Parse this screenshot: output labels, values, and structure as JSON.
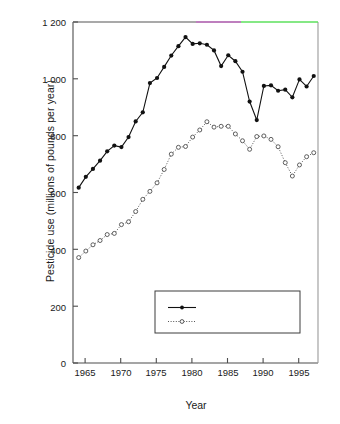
{
  "chart_data": {
    "type": "line",
    "title": "",
    "xlabel": "Year",
    "ylabel": "Pesticide use (millions of pounds per year)",
    "xlim": [
      1963.2,
      1997.6
    ],
    "ylim": [
      0,
      1200
    ],
    "xticks": [
      1965,
      1970,
      1975,
      1980,
      1985,
      1990,
      1995
    ],
    "xtick_labels": [
      "1965",
      "1970",
      "1975",
      "1980",
      "1985",
      "1990",
      "1995"
    ],
    "yticks": [
      0,
      200,
      400,
      600,
      800,
      1000,
      1200
    ],
    "ytick_labels": [
      "0",
      "200",
      "400",
      "600",
      "800",
      "1 000",
      "1 200"
    ],
    "grid": false,
    "legend_position": "lower right",
    "x": [
      1964,
      1965,
      1966,
      1967,
      1968,
      1969,
      1970,
      1971,
      1972,
      1973,
      1974,
      1975,
      1976,
      1977,
      1978,
      1979,
      1980,
      1981,
      1982,
      1983,
      1984,
      1985,
      1986,
      1987,
      1988,
      1989,
      1990,
      1991,
      1992,
      1993,
      1994,
      1995,
      1996,
      1997
    ],
    "series": [
      {
        "name": "Total pesticides",
        "marker": "filled-circle",
        "line": "solid",
        "color": "#111111",
        "values": [
          617,
          655,
          683,
          712,
          745,
          765,
          760,
          795,
          850,
          882,
          985,
          1003,
          1042,
          1082,
          1115,
          1147,
          1123,
          1125,
          1120,
          1100,
          1045,
          1083,
          1062,
          1025,
          920,
          855,
          975,
          977,
          958,
          962,
          935,
          998,
          973,
          1010
        ]
      },
      {
        "name": "Agricultural pesticides",
        "marker": "open-circle",
        "line": "dotted",
        "color": "#555555",
        "values": [
          371,
          394,
          416,
          431,
          452,
          456,
          487,
          497,
          533,
          576,
          604,
          634,
          681,
          735,
          759,
          762,
          795,
          820,
          849,
          830,
          833,
          833,
          806,
          782,
          752,
          797,
          799,
          787,
          761,
          705,
          658,
          697,
          726,
          740
        ]
      }
    ]
  },
  "chart_series_total": {
    "points": [
      {
        "year": 1964,
        "value": 617
      },
      {
        "year": 1965,
        "value": 655
      },
      {
        "year": 1966,
        "value": 683
      },
      {
        "year": 1967,
        "value": 712
      },
      {
        "year": 1968,
        "value": 745
      },
      {
        "year": 1969,
        "value": 765
      },
      {
        "year": 1970,
        "value": 760
      },
      {
        "year": 1971,
        "value": 795
      },
      {
        "year": 1972,
        "value": 850
      },
      {
        "year": 1973,
        "value": 882
      },
      {
        "year": 1974,
        "value": 985
      },
      {
        "year": 1975,
        "value": 1003
      },
      {
        "year": 1976,
        "value": 1042
      },
      {
        "year": 1977,
        "value": 1082
      },
      {
        "year": 1978,
        "value": 1115
      },
      {
        "year": 1979,
        "value": 1147
      },
      {
        "year": 1980,
        "value": 1123
      },
      {
        "year": 1981,
        "value": 1125
      },
      {
        "year": 1982,
        "value": 1120
      },
      {
        "year": 1983,
        "value": 1100
      },
      {
        "year": 1984,
        "value": 1045
      },
      {
        "year": 1985,
        "value": 1083
      },
      {
        "year": 1986,
        "value": 1062
      },
      {
        "year": 1987,
        "value": 1025
      },
      {
        "year": 1988,
        "value": 920
      },
      {
        "year": 1989,
        "value": 855
      },
      {
        "year": 1990,
        "value": 975
      },
      {
        "year": 1991,
        "value": 977
      },
      {
        "year": 1992,
        "value": 958
      },
      {
        "year": 1993,
        "value": 962
      },
      {
        "year": 1994,
        "value": 935
      },
      {
        "year": 1995,
        "value": 998
      },
      {
        "year": 1996,
        "value": 973
      },
      {
        "year": 1997,
        "value": 1010
      }
    ]
  },
  "chart_series_agricultural": {
    "points": [
      {
        "year": 1964,
        "value": 371
      },
      {
        "year": 1965,
        "value": 394
      },
      {
        "year": 1966,
        "value": 416
      },
      {
        "year": 1967,
        "value": 431
      },
      {
        "year": 1968,
        "value": 452
      },
      {
        "year": 1969,
        "value": 456
      },
      {
        "year": 1970,
        "value": 487
      },
      {
        "year": 1971,
        "value": 497
      },
      {
        "year": 1972,
        "value": 533
      },
      {
        "year": 1973,
        "value": 576
      },
      {
        "year": 1974,
        "value": 604
      },
      {
        "year": 1975,
        "value": 634
      },
      {
        "year": 1976,
        "value": 681
      },
      {
        "year": 1977,
        "value": 735
      },
      {
        "year": 1978,
        "value": 759
      },
      {
        "year": 1979,
        "value": 762
      },
      {
        "year": 1980,
        "value": 795
      },
      {
        "year": 1981,
        "value": 820
      },
      {
        "year": 1982,
        "value": 849
      },
      {
        "year": 1983,
        "value": 830
      },
      {
        "year": 1984,
        "value": 833
      },
      {
        "year": 1985,
        "value": 833
      },
      {
        "year": 1986,
        "value": 806
      },
      {
        "year": 1987,
        "value": 782
      },
      {
        "year": 1988,
        "value": 752
      },
      {
        "year": 1989,
        "value": 797
      },
      {
        "year": 1990,
        "value": 799
      },
      {
        "year": 1991,
        "value": 787
      },
      {
        "year": 1992,
        "value": 761
      },
      {
        "year": 1993,
        "value": 705
      },
      {
        "year": 1994,
        "value": 658
      },
      {
        "year": 1995,
        "value": 697
      },
      {
        "year": 1996,
        "value": 726
      },
      {
        "year": 1997,
        "value": 740
      }
    ]
  },
  "axes": {
    "ylabel": "Pesticide use (millions of pounds per year)",
    "xlabel": "Year",
    "ytick_labels": [
      "1 200",
      "1 000",
      "800",
      "600",
      "400",
      "200",
      "0"
    ],
    "xtick_labels": [
      "1965",
      "1970",
      "1975",
      "1980",
      "1985",
      "1990",
      "1995"
    ]
  },
  "legend": {
    "entries": [
      {
        "label": "Total pesticides",
        "marker": "filled-circle",
        "line": "solid"
      },
      {
        "label": "Agricultural pesticides",
        "marker": "open-circle",
        "line": "dotted"
      }
    ]
  },
  "colors": {
    "ink": "#111111",
    "axis": "#4d4d4d",
    "dotted_series": "#555555",
    "top_border_artifact_purple": "#a855a8",
    "top_border_artifact_green": "#5ce05c",
    "background": "#ffffff"
  }
}
